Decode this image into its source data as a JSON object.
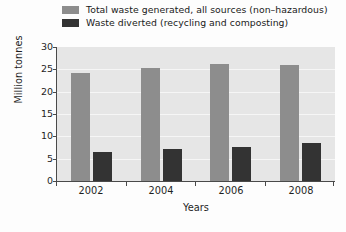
{
  "chart_data": {
    "type": "bar",
    "title": "",
    "xlabel": "Years",
    "ylabel": "Million tonnes",
    "categories": [
      "2002",
      "2004",
      "2006",
      "2008"
    ],
    "ylim": [
      0,
      30
    ],
    "yticks": [
      0,
      5,
      10,
      15,
      20,
      25,
      30
    ],
    "ytick_labels": [
      "0",
      "5",
      "10",
      "15",
      "20",
      "25",
      "30"
    ],
    "grid": true,
    "legend_position": "top",
    "series": [
      {
        "name": "Total waste generated, all sources (non-hazardous)",
        "color": "#8d8d8d",
        "values": [
          24.1,
          25.3,
          26.1,
          26.0
        ]
      },
      {
        "name": "Waste diverted (recycling and composting)",
        "color": "#333333",
        "values": [
          6.6,
          7.1,
          7.7,
          8.4
        ]
      }
    ]
  },
  "legend": {
    "items": [
      {
        "label": "Total waste generated, all sources (non–hazardous)",
        "swatch": "#8d8d8d"
      },
      {
        "label": "Waste diverted (recycling and composting)",
        "swatch": "#333333"
      }
    ]
  },
  "axes": {
    "y_title": "Million tonnes",
    "x_title": "Years"
  }
}
